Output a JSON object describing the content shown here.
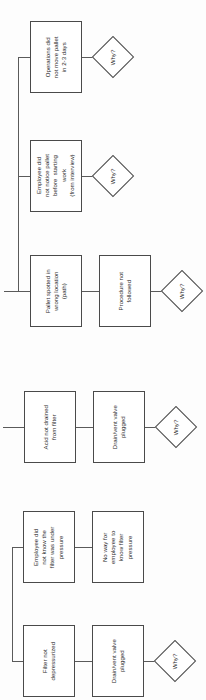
{
  "diagram": {
    "orientation": "text-rotated-90-ccw",
    "line_color": "#5a5a5a",
    "box_border_color": "#4a4a4a",
    "box_fill": "#ffffff",
    "page_background": "#fdfdfd"
  },
  "groups": [
    {
      "id": "group-pallet",
      "nodes": [
        {
          "id": "node-operations-did-not-move-pallet",
          "name": "operations-did-not-move-pallet-box",
          "text": "Operations did\nnot move pallet\nin 2-3 days"
        },
        {
          "id": "node-employee-did-not-notice-pallet",
          "name": "employee-did-not-notice-pallet-box",
          "text": "Employee did\nnot notice pallet\nbefore  starting\nwork\n(from interview)"
        },
        {
          "id": "node-pallet-spotted-wrong-location",
          "name": "pallet-spotted-wrong-location-box",
          "text": "Pallet spotted in\nwrong location\n(path)"
        },
        {
          "id": "node-procedure-not-followed",
          "name": "procedure-not-followed-box",
          "text": "Procedure not\nfollowed"
        }
      ],
      "decisions": [
        {
          "id": "why-1",
          "text": "Why?"
        },
        {
          "id": "why-2",
          "text": "Why?"
        },
        {
          "id": "why-3",
          "text": "Why?"
        }
      ]
    },
    {
      "id": "group-acid",
      "nodes": [
        {
          "id": "node-acid-not-drained",
          "name": "acid-not-drained-box",
          "text": "Acid not drained\nfrom filter"
        },
        {
          "id": "node-drain-vent-valve-plugged-a",
          "name": "drain-vent-valve-plugged-box",
          "text": "Drain/vent valve\nplugged"
        }
      ],
      "decisions": [
        {
          "id": "why-4",
          "text": "Why?"
        }
      ]
    },
    {
      "id": "group-pressure",
      "nodes": [
        {
          "id": "node-employee-did-not-know-pressure",
          "name": "employee-did-not-know-pressure-box",
          "text": "Employee did\nnot know the\nfilter was under\npressure"
        },
        {
          "id": "node-no-way-to-know-filter-pressure",
          "name": "no-way-to-know-filter-pressure-box",
          "text": "No way for\nemployee to\nknow filter\npressure"
        },
        {
          "id": "node-filter-not-depressurized",
          "name": "filter-not-depressurized-box",
          "text": "Filter not\ndepressurized"
        },
        {
          "id": "node-drain-vent-valve-plugged-b",
          "name": "drain-vent-valve-plugged-box",
          "text": "Drain/vent valve\nplugged"
        }
      ],
      "decisions": [
        {
          "id": "why-5",
          "text": "Why?"
        }
      ]
    }
  ]
}
